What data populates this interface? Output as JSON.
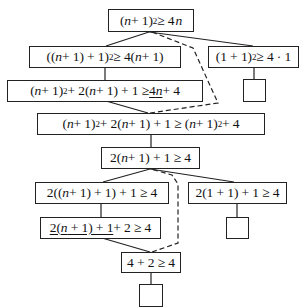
{
  "diagram": {
    "type": "proof-tree",
    "nodes": [
      {
        "id": "n1",
        "label": "(n + 1)² ≥ 4n",
        "parts": [
          "(",
          "n",
          " + 1)",
          "2",
          " ≥ 4",
          "n"
        ]
      },
      {
        "id": "n2",
        "label": "((n + 1) + 1)² ≥ 4(n + 1)",
        "parts": [
          "((",
          "n",
          " + 1) + 1)",
          "2",
          " ≥ 4(",
          "n",
          " + 1)"
        ]
      },
      {
        "id": "n3",
        "label": "(1 + 1)² ≥ 4 · 1",
        "parts": [
          "(1 + 1)",
          "2",
          " ≥ 4 · 1"
        ]
      },
      {
        "id": "n4",
        "label": "(n + 1)² + 2(n + 1) + 1 ≥ 4n + 4",
        "parts": [
          "(",
          "n",
          " + 1)",
          "2",
          " + 2(",
          "n",
          " + 1) + 1 ≥ ",
          "4n",
          " + 4"
        ],
        "underlined": "4n"
      },
      {
        "id": "n4b",
        "label": "",
        "empty": true
      },
      {
        "id": "n5",
        "label": "(n + 1)² + 2(n + 1) + 1 ≥ (n + 1)² + 4",
        "parts": [
          "(",
          "n",
          " + 1)",
          "2",
          " + 2(",
          "n",
          " + 1) + 1 ≥ (",
          "n",
          " + 1)",
          "2",
          " + 4"
        ]
      },
      {
        "id": "n6",
        "label": "2(n + 1) + 1 ≥ 4",
        "parts": [
          "2(",
          "n",
          " + 1) + 1 ≥ 4"
        ]
      },
      {
        "id": "n7",
        "label": "2((n + 1) + 1) + 1 ≥ 4",
        "parts": [
          "2((",
          "n",
          " + 1) + 1) + 1 ≥ 4"
        ]
      },
      {
        "id": "n8",
        "label": "2(1 + 1) + 1 ≥ 4",
        "parts": [
          "2(1 + 1) + 1 ≥ 4"
        ]
      },
      {
        "id": "n9",
        "label": "2(n + 1) + 1 + 2 ≥ 4",
        "parts": [
          "2(",
          "n",
          " + 1) + 1",
          " + 2 ≥ 4"
        ],
        "underlined": "2(n + 1) + 1"
      },
      {
        "id": "n8b",
        "label": "",
        "empty": true
      },
      {
        "id": "n10",
        "label": "4 + 2 ≥ 4",
        "parts": [
          "4 + 2 ≥ 4"
        ]
      },
      {
        "id": "n10b",
        "label": "",
        "empty": true
      }
    ],
    "edges": [
      {
        "from": "n1",
        "to": "n2",
        "style": "solid"
      },
      {
        "from": "n1",
        "to": "n3",
        "style": "solid"
      },
      {
        "from": "n2",
        "to": "n4",
        "style": "solid"
      },
      {
        "from": "n3",
        "to": "n4b",
        "style": "solid"
      },
      {
        "from": "n4",
        "to": "n5",
        "style": "solid"
      },
      {
        "from": "n5",
        "to": "n1",
        "style": "dashed"
      },
      {
        "from": "n5",
        "to": "n6",
        "style": "solid"
      },
      {
        "from": "n6",
        "to": "n7",
        "style": "solid"
      },
      {
        "from": "n6",
        "to": "n8",
        "style": "solid"
      },
      {
        "from": "n7",
        "to": "n9",
        "style": "solid"
      },
      {
        "from": "n8",
        "to": "n8b",
        "style": "solid"
      },
      {
        "from": "n9",
        "to": "n10",
        "style": "solid"
      },
      {
        "from": "n10",
        "to": "n6",
        "style": "dashed"
      },
      {
        "from": "n10",
        "to": "n10b",
        "style": "solid"
      }
    ],
    "colors": {
      "stroke": "#222222",
      "background": "#ffffff",
      "text": "#111111"
    }
  },
  "t": {
    "n1": {
      "a": "(",
      "b": "n",
      "c": " + 1)",
      "d": "2",
      "e": " ≥ 4",
      "f": "n"
    },
    "n2": {
      "a": "((",
      "b": "n",
      "c": " + 1) + 1)",
      "d": "2",
      "e": " ≥ 4(",
      "f": "n",
      "g": " + 1)"
    },
    "n3": {
      "a": "(1 + 1)",
      "b": "2",
      "c": " ≥ 4 · 1"
    },
    "n4": {
      "a": "(",
      "b": "n",
      "c": " + 1)",
      "d": "2",
      "e": " + 2(",
      "f": "n",
      "g": " + 1) + 1 ≥ ",
      "h": "4",
      "i": "n",
      "j": " + 4"
    },
    "n5": {
      "a": "(",
      "b": "n",
      "c": " + 1)",
      "d": "2",
      "e": " + 2(",
      "f": "n",
      "g": " + 1) + 1 ≥ (",
      "h": "n",
      "i": " + 1)",
      "j": "2",
      "k": " + 4"
    },
    "n6": {
      "a": "2(",
      "b": "n",
      "c": " + 1) + 1 ≥ 4"
    },
    "n7": {
      "a": "2((",
      "b": "n",
      "c": " + 1) + 1) + 1 ≥ 4"
    },
    "n8": {
      "a": "2(1 + 1) + 1 ≥ 4"
    },
    "n9": {
      "a": "2(",
      "b": "n",
      "c": " + 1) + 1",
      "d": " + 2 ≥ 4"
    },
    "n10": {
      "a": "4 + 2 ≥ 4"
    }
  }
}
